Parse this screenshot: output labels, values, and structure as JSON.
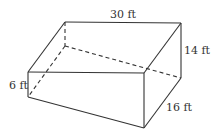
{
  "diagram": {
    "type": "rectangular-prism-wedge",
    "stroke_color": "#333333",
    "labels": {
      "top_length": "30 ft",
      "back_height": "14 ft",
      "front_height": "6 ft",
      "depth": "16 ft"
    }
  }
}
